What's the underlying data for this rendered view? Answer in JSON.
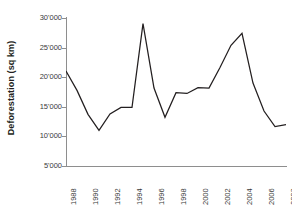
{
  "chart_data": {
    "type": "line",
    "title": "",
    "xlabel": "",
    "ylabel": "Deforestation (sq km)",
    "xlim": [
      1988,
      2008
    ],
    "ylim": [
      5000,
      30000
    ],
    "grid": false,
    "legend": null,
    "y_tick_labels": [
      "30'000",
      "25'000",
      "20'000",
      "15'000",
      "10'000",
      "5'000"
    ],
    "y_tick_values": [
      30000,
      25000,
      20000,
      15000,
      10000,
      5000
    ],
    "x_tick_labels": [
      "1988",
      "1990",
      "1992",
      "1994",
      "1996",
      "1998",
      "2000",
      "2002",
      "2004",
      "2006",
      "2008"
    ],
    "x_tick_values": [
      1988,
      1990,
      1992,
      1994,
      1996,
      1998,
      2000,
      2002,
      2004,
      2006,
      2008
    ],
    "x": [
      1988,
      1989,
      1990,
      1991,
      1992,
      1993,
      1994,
      1995,
      1996,
      1997,
      1998,
      1999,
      2000,
      2001,
      2002,
      2003,
      2004,
      2005,
      2006,
      2007,
      2008
    ],
    "values": [
      21050,
      17770,
      13730,
      11030,
      13786,
      14896,
      14896,
      29059,
      18161,
      13227,
      17383,
      17259,
      18226,
      18165,
      21651,
      25396,
      27423,
      19014,
      14286,
      11651,
      12000
    ],
    "series_name": "Deforestation",
    "line_color": "#231f20",
    "axis_color": "#8e8e8e",
    "tick_text_color": "#3a3a3a"
  },
  "axis": {
    "y_title": "Deforestation (sq km)"
  },
  "caption": {
    "text": ""
  }
}
